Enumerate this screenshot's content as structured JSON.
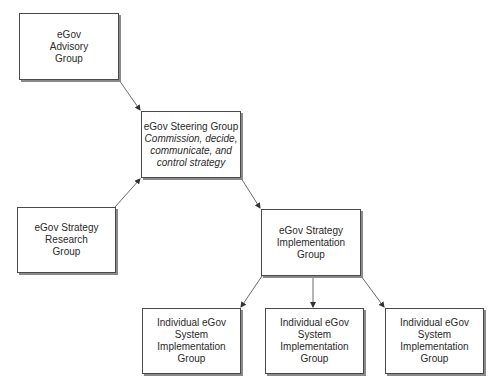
{
  "diagram": {
    "type": "organizational-flow",
    "nodes": [
      {
        "id": "advisory",
        "title_lines": [
          "eGov",
          "Advisory",
          "Group"
        ],
        "subtitle_lines": []
      },
      {
        "id": "steering",
        "title_lines": [
          "eGov Steering Group"
        ],
        "subtitle_lines": [
          "Commission, decide,",
          "communicate, and",
          "control strategy"
        ]
      },
      {
        "id": "research",
        "title_lines": [
          "eGov Strategy",
          "Research",
          "Group"
        ],
        "subtitle_lines": []
      },
      {
        "id": "implementation",
        "title_lines": [
          "eGov Strategy",
          "Implementation",
          "Group"
        ],
        "subtitle_lines": []
      },
      {
        "id": "system1",
        "title_lines": [
          "Individual eGov",
          "System",
          "Implementation",
          "Group"
        ],
        "subtitle_lines": []
      },
      {
        "id": "system2",
        "title_lines": [
          "Individual eGov",
          "System",
          "Implementation",
          "Group"
        ],
        "subtitle_lines": []
      },
      {
        "id": "system3",
        "title_lines": [
          "Individual eGov",
          "System",
          "Implementation",
          "Group"
        ],
        "subtitle_lines": []
      }
    ],
    "edges": [
      {
        "from": "advisory",
        "to": "steering"
      },
      {
        "from": "research",
        "to": "steering"
      },
      {
        "from": "steering",
        "to": "implementation"
      },
      {
        "from": "implementation",
        "to": "system1"
      },
      {
        "from": "implementation",
        "to": "system2"
      },
      {
        "from": "implementation",
        "to": "system3"
      }
    ],
    "colors": {
      "border": "#4a4a4a",
      "shadow": "#8a8a8a",
      "arrow": "#4a4a4a",
      "text": "#2a2a2a",
      "background": "#ffffff"
    }
  }
}
